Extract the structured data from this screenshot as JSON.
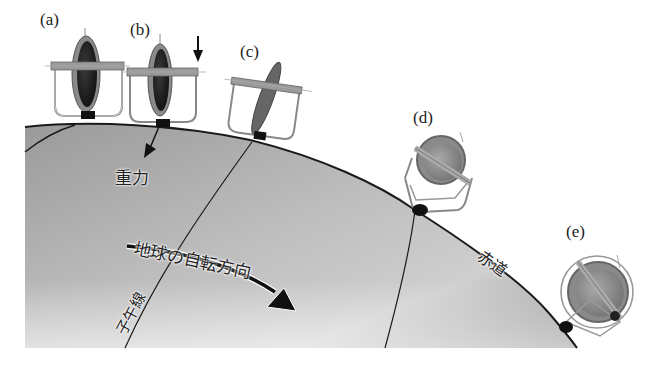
{
  "labels": {
    "a": "(a)",
    "b": "(b)",
    "c": "(c)",
    "d": "(d)",
    "e": "(e)"
  },
  "annotations": {
    "gravity": "重力",
    "rotation_direction": "地球の自転方向",
    "meridian": "子午線",
    "equator": "赤道"
  },
  "colors": {
    "globe_dark": "#8c8c8c",
    "globe_light": "#e2e2e2",
    "outline": "#1a1a1a",
    "rotor": "#7a7a7a",
    "gimbal_bar": "#9a9a9a"
  }
}
